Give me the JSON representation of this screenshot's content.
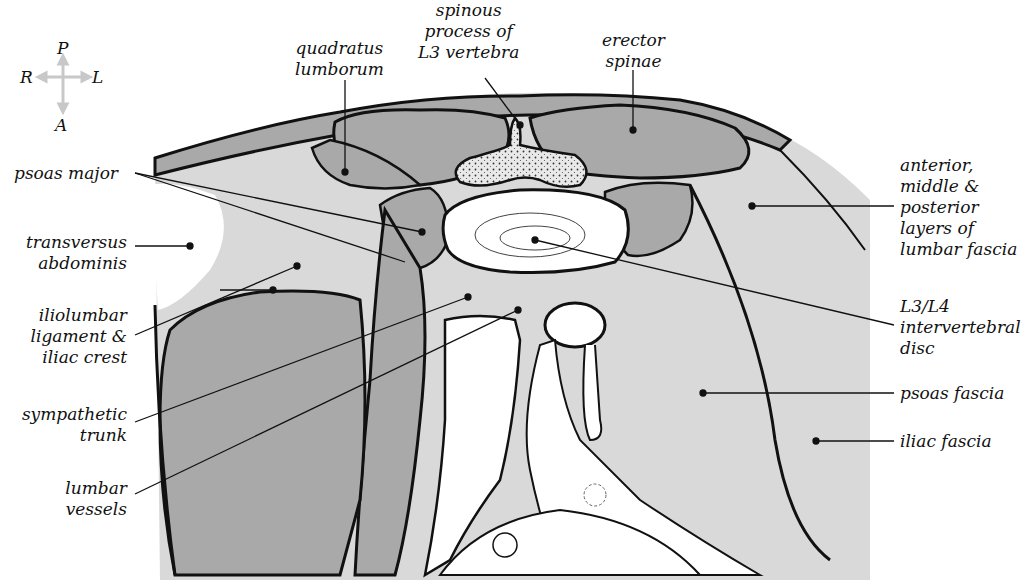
{
  "figure": {
    "type": "anatomical cross-section illustration",
    "colors": {
      "background": "#ffffff",
      "muscle_dark": "#a9a9a9",
      "fascia_light": "#d9d9d9",
      "bone_stipple": "#e8e8e8",
      "outline": "#111111",
      "compass_arrow": "#c8c8c8"
    }
  },
  "compass": {
    "top": "P",
    "left": "R",
    "right": "L",
    "bottom": "A"
  },
  "labels": {
    "quadratus_lumborum": [
      "quadratus",
      "lumborum"
    ],
    "spinous_process": [
      "spinous",
      "process of",
      "L3 vertebra"
    ],
    "erector_spinae": [
      "erector",
      "spinae"
    ],
    "psoas_major": [
      "psoas major"
    ],
    "transversus_abdominis": [
      "transversus",
      "abdominis"
    ],
    "iliolumbar_ligament": [
      "iliolumbar",
      "ligament &",
      "iliac crest"
    ],
    "sympathetic_trunk": [
      "sympathetic",
      "trunk"
    ],
    "lumbar_vessels": [
      "lumbar",
      "vessels"
    ],
    "lumbar_fascia": [
      "anterior,",
      "middle &",
      "posterior",
      "layers of",
      "lumbar fascia"
    ],
    "intervertebral_disc": [
      "L3/L4",
      "intervertebral",
      "disc"
    ],
    "psoas_fascia": [
      "psoas fascia"
    ],
    "iliac_fascia": [
      "iliac fascia"
    ]
  }
}
